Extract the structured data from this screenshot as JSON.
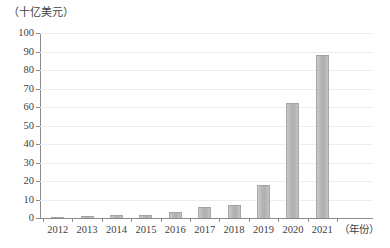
{
  "chart_data": {
    "type": "bar",
    "title": "",
    "subtitle": "",
    "xlabel": "（年份）",
    "ylabel": "（十亿美元）",
    "categories": [
      "2012",
      "2013",
      "2014",
      "2015",
      "2016",
      "2017",
      "2018",
      "2019",
      "2020",
      "2021"
    ],
    "values": [
      0.6,
      1.2,
      1.8,
      1.6,
      3.2,
      5.8,
      7.2,
      17.8,
      62,
      88
    ],
    "series": [
      {
        "name": "",
        "values": [
          0.6,
          1.2,
          1.8,
          1.6,
          3.2,
          5.8,
          7.2,
          17.8,
          62,
          88
        ]
      }
    ],
    "ylim": [
      0,
      100
    ],
    "ytick_labels": [
      "100",
      "90",
      "80",
      "70",
      "60",
      "50",
      "40",
      "30",
      "20",
      "10",
      "0"
    ],
    "ytick_values": [
      100,
      90,
      80,
      70,
      60,
      50,
      40,
      30,
      20,
      10,
      0
    ],
    "ystep": 10,
    "grid": true,
    "grid_axis": "y",
    "legend": false,
    "legend_position": "none",
    "bar_color": "#b4b4b4",
    "bar_edge_color": "#a2a2a2",
    "axis_color": "#8a8a8a",
    "gridline_color": "#ededed",
    "text_color": "#3f3f3f",
    "background_color": "#ffffff"
  }
}
